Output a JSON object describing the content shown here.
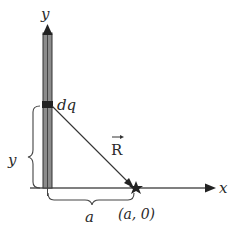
{
  "diagram": {
    "axes": {
      "x_label": "x",
      "y_label": "y"
    },
    "charge_element_label": "dq",
    "vector_label": "R",
    "point_label": "(a, 0)",
    "brace_vertical_label": "y",
    "brace_horizontal_label": "a",
    "colors": {
      "rod_fill": "#8a8a8a",
      "rod_edge": "#3a3a3a",
      "dq_fill": "#222222",
      "axis": "#555555",
      "text": "#2a2a2a"
    }
  }
}
